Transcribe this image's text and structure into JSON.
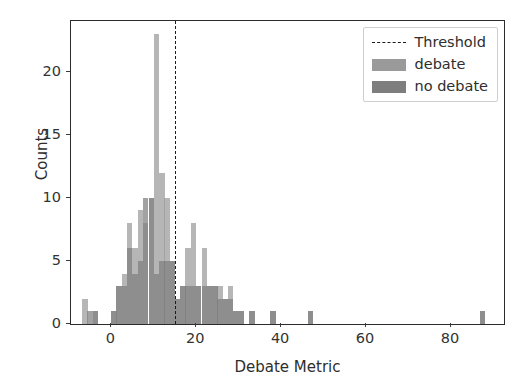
{
  "chart_data": {
    "type": "bar",
    "title": "",
    "subtitle": "",
    "xlabel": "Debate Metric",
    "ylabel": "Counts",
    "xlim": [
      -9.5,
      92.5
    ],
    "ylim": [
      0,
      24
    ],
    "xticks": [
      0,
      20,
      40,
      60,
      80
    ],
    "yticks": [
      0,
      5,
      10,
      15,
      20
    ],
    "grid": false,
    "legend_position": "upper right",
    "bin_width": 1.26,
    "annotations": [
      {
        "name": "threshold",
        "type": "vline",
        "x": 15,
        "style": "dashed",
        "color": "#1a1a1a",
        "label": "Threshold"
      }
    ],
    "legend": [
      {
        "label": "Threshold",
        "kind": "line",
        "style": "dashed",
        "color": "#1a1a1a"
      },
      {
        "label": "debate",
        "kind": "patch",
        "color": "#9a9a9a"
      },
      {
        "label": "no debate",
        "kind": "patch",
        "color": "#7e7e7e"
      }
    ],
    "series": [
      {
        "name": "debate",
        "color": "#9a9a9a",
        "x": [
          -6.2,
          -5.0,
          -3.7,
          0.6,
          1.8,
          3.1,
          4.3,
          5.6,
          6.8,
          8.1,
          9.4,
          10.6,
          11.9,
          13.1,
          14.4,
          15.6,
          16.9,
          18.1,
          19.4,
          20.6,
          21.9,
          23.1,
          24.4,
          25.6,
          26.9,
          28.1,
          29.4,
          30.6,
          33.1,
          38.1,
          46.9,
          87.5
        ],
        "values": [
          2,
          0,
          1,
          1,
          3,
          4,
          8,
          6,
          9,
          8,
          10,
          23,
          12,
          10,
          5,
          2,
          3,
          6,
          8,
          3,
          6,
          3,
          3,
          3,
          2,
          3,
          1,
          1,
          1,
          1,
          1,
          1
        ]
      },
      {
        "name": "no debate",
        "color": "#7e7e7e",
        "x": [
          -6.2,
          -5.0,
          -3.7,
          0.6,
          1.8,
          3.1,
          4.3,
          5.6,
          6.8,
          8.1,
          9.4,
          10.6,
          11.9,
          13.1,
          14.4,
          15.6,
          16.9,
          18.1,
          19.4,
          20.6,
          21.9,
          23.1,
          24.4,
          25.6,
          26.9,
          28.1,
          29.4,
          30.6,
          33.1,
          38.1,
          46.9,
          87.5
        ],
        "values": [
          0,
          1,
          1,
          1,
          3,
          3,
          6,
          4,
          5,
          10,
          10,
          4,
          5,
          5,
          5,
          2,
          3,
          3,
          3,
          3,
          3,
          3,
          3,
          2,
          2,
          2,
          1,
          1,
          1,
          1,
          1,
          1
        ]
      }
    ]
  }
}
